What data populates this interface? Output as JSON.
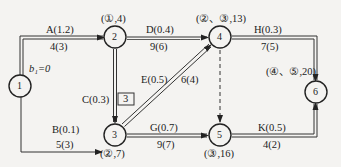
{
  "diagram": {
    "type": "activity-on-arrow network",
    "nodes": [
      {
        "id": "1",
        "label": "1",
        "x": 20,
        "y": 86
      },
      {
        "id": "2",
        "label": "2",
        "x": 115,
        "y": 37,
        "mark": "(①,4)"
      },
      {
        "id": "3",
        "label": "3",
        "x": 115,
        "y": 135,
        "mark": "(②,7)"
      },
      {
        "id": "4",
        "label": "4",
        "x": 220,
        "y": 37,
        "mark": "(②、③,13)"
      },
      {
        "id": "5",
        "label": "5",
        "x": 220,
        "y": 135,
        "mark": "(③,16)"
      },
      {
        "id": "6",
        "label": "6",
        "x": 316,
        "y": 92,
        "mark": "(④、⑤,20)"
      }
    ],
    "edges": [
      {
        "id": "A",
        "from": "1",
        "to": "2",
        "name": "A(1.2)",
        "duration": "4(3)",
        "double": true
      },
      {
        "id": "B",
        "from": "1",
        "to": "3",
        "name": "B(0.1)",
        "duration": "5(3)",
        "double": false
      },
      {
        "id": "C",
        "from": "2",
        "to": "3",
        "name": "C(0.3)",
        "duration": "",
        "double": true
      },
      {
        "id": "D",
        "from": "2",
        "to": "4",
        "name": "D(0.4)",
        "duration": "9(6)",
        "double": false
      },
      {
        "id": "E",
        "from": "3",
        "to": "4",
        "name": "E(0.5)",
        "duration": "6(4)",
        "double": true
      },
      {
        "id": "G",
        "from": "3",
        "to": "5",
        "name": "G(0.7)",
        "duration": "9(7)",
        "double": true
      },
      {
        "id": "H",
        "from": "4",
        "to": "6",
        "name": "H(0.3)",
        "duration": "7(5)",
        "double": true
      },
      {
        "id": "K",
        "from": "5",
        "to": "6",
        "name": "K(0.5)",
        "duration": "4(2)",
        "double": true
      },
      {
        "id": "dummy",
        "from": "4",
        "to": "5",
        "name": "",
        "duration": "",
        "dashed": true
      }
    ],
    "start_label": "b₁=0",
    "boxed_value": "3"
  }
}
